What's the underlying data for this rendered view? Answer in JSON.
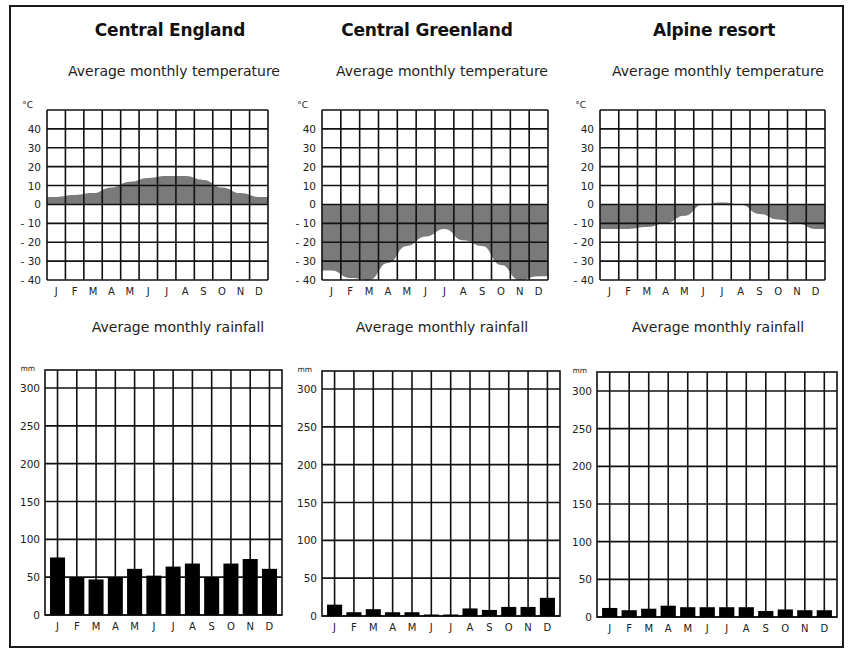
{
  "chart_data": [
    {
      "type": "area",
      "title": "Central England",
      "subtitle": "Average monthly temperature",
      "ylabel": "°C",
      "categories": [
        "J",
        "F",
        "M",
        "A",
        "M",
        "J",
        "J",
        "A",
        "S",
        "O",
        "N",
        "D"
      ],
      "values": [
        4,
        5,
        6,
        9,
        12,
        14,
        15,
        15,
        13,
        9,
        6,
        4
      ],
      "ylim": [
        -40,
        50
      ],
      "yticks": [
        40,
        30,
        20,
        10,
        0,
        -10,
        -20,
        -30,
        -40
      ],
      "grid": true,
      "fill_color": "#7a7a7a"
    },
    {
      "type": "area",
      "title": "Central Greenland",
      "subtitle": "Average monthly temperature",
      "ylabel": "°C",
      "categories": [
        "J",
        "F",
        "M",
        "A",
        "M",
        "J",
        "J",
        "A",
        "S",
        "O",
        "N",
        "D"
      ],
      "values": [
        -35,
        -39,
        -40,
        -31,
        -22,
        -17,
        -13,
        -19,
        -22,
        -32,
        -40,
        -38
      ],
      "ylim": [
        -40,
        50
      ],
      "yticks": [
        40,
        30,
        20,
        10,
        0,
        -10,
        -20,
        -30,
        -40
      ],
      "grid": true,
      "fill_color": "#7a7a7a"
    },
    {
      "type": "area",
      "title": "Alpine resort",
      "subtitle": "Average monthly temperature",
      "ylabel": "°C",
      "categories": [
        "J",
        "F",
        "M",
        "A",
        "M",
        "J",
        "J",
        "A",
        "S",
        "O",
        "N",
        "D"
      ],
      "values": [
        -13,
        -13,
        -12,
        -10,
        -6,
        0,
        1,
        0,
        -5,
        -8,
        -10,
        -13
      ],
      "ylim": [
        -40,
        50
      ],
      "yticks": [
        40,
        30,
        20,
        10,
        0,
        -10,
        -20,
        -30,
        -40
      ],
      "grid": true,
      "fill_color": "#7a7a7a"
    },
    {
      "type": "bar",
      "title": "Central England",
      "subtitle": "Average monthly rainfall",
      "ylabel": "mm",
      "categories": [
        "J",
        "F",
        "M",
        "A",
        "M",
        "J",
        "J",
        "A",
        "S",
        "O",
        "N",
        "D"
      ],
      "values": [
        76,
        50,
        47,
        50,
        61,
        52,
        64,
        68,
        50,
        68,
        74,
        61
      ],
      "ylim": [
        0,
        325
      ],
      "yticks": [
        300,
        250,
        200,
        150,
        100,
        50,
        0
      ],
      "grid": true,
      "bar_color": "#000000"
    },
    {
      "type": "bar",
      "title": "Central Greenland",
      "subtitle": "Average monthly rainfall",
      "ylabel": "mm",
      "categories": [
        "J",
        "F",
        "M",
        "A",
        "M",
        "J",
        "J",
        "A",
        "S",
        "O",
        "N",
        "D"
      ],
      "values": [
        15,
        5,
        9,
        5,
        5,
        2,
        2,
        10,
        8,
        12,
        12,
        24
      ],
      "ylim": [
        0,
        325
      ],
      "yticks": [
        300,
        250,
        200,
        150,
        100,
        50,
        0
      ],
      "grid": true,
      "bar_color": "#000000"
    },
    {
      "type": "bar",
      "title": "Alpine resort",
      "subtitle": "Average monthly rainfall",
      "ylabel": "mm",
      "categories": [
        "J",
        "F",
        "M",
        "A",
        "M",
        "J",
        "J",
        "A",
        "S",
        "O",
        "N",
        "D"
      ],
      "values": [
        12,
        9,
        11,
        15,
        13,
        13,
        13,
        13,
        8,
        10,
        9,
        9
      ],
      "ylim": [
        0,
        325
      ],
      "yticks": [
        300,
        250,
        200,
        150,
        100,
        50,
        0
      ],
      "grid": true,
      "bar_color": "#000000"
    }
  ],
  "panels": [
    {
      "title": "Central England",
      "temp_subtitle": "Average monthly temperature",
      "rain_subtitle": "Average monthly rainfall"
    },
    {
      "title": "Central Greenland",
      "temp_subtitle": "Average monthly temperature",
      "rain_subtitle": "Average monthly rainfall"
    },
    {
      "title": "Alpine resort",
      "temp_subtitle": "Average monthly temperature",
      "rain_subtitle": "Average monthly rainfall"
    }
  ],
  "units": {
    "temp": "°C",
    "rain": "mm"
  }
}
